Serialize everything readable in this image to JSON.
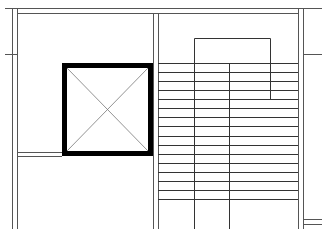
{
  "diagram": {
    "type": "architectural-floor-plan",
    "width": 327,
    "height": 243,
    "colors": {
      "background": "#ffffff",
      "line": "#333333",
      "wall_thick": "#000000",
      "x_mark": "#666666"
    },
    "elements": {
      "elevator": {
        "x": 62,
        "y": 63,
        "w": 90,
        "h": 92,
        "border": 5,
        "symbol": "x-cross"
      },
      "stair": {
        "x_left": 158,
        "x_right": 298,
        "treads_y": [
          63,
          72,
          81,
          90,
          99,
          108,
          117,
          126,
          136,
          145,
          154,
          163,
          172,
          181,
          190,
          199
        ],
        "stringers_x": [
          194,
          229
        ],
        "handrail": {
          "x1": 194,
          "x2": 270,
          "top": 38,
          "right_leg_bottom": 100
        }
      }
    }
  }
}
